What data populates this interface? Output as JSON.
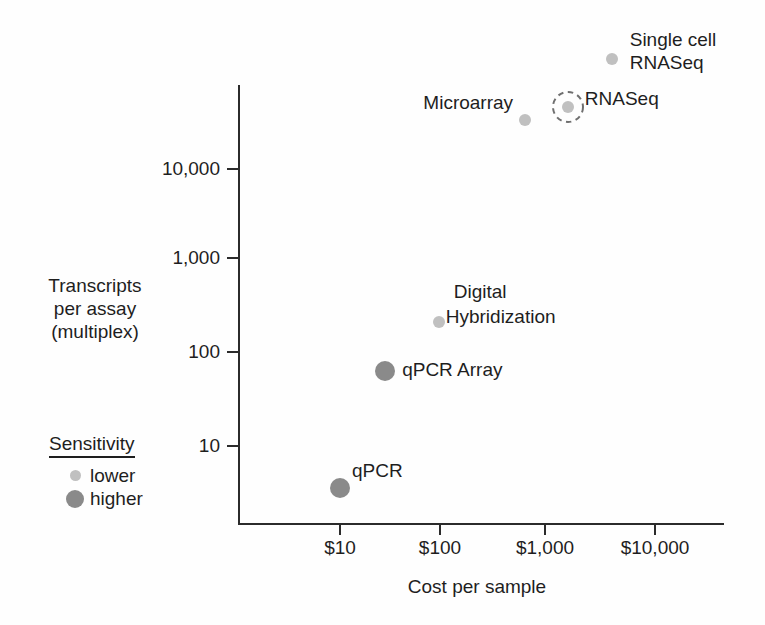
{
  "figure": {
    "y_side_label": {
      "lines": [
        "Transcripts",
        "per assay",
        "(multiplex)"
      ]
    },
    "legend": {
      "title": "Sensitivity",
      "items": [
        {
          "label": "lower",
          "sensitivity": "lower"
        },
        {
          "label": "higher",
          "sensitivity": "higher"
        }
      ]
    },
    "colors": {
      "sensitivity_lower": "#c0c0c0",
      "sensitivity_higher": "#8a8a8a",
      "axis": "#2b2b2b",
      "text": "#1e1e1e",
      "highlight_ring": "#6f6f6f"
    }
  },
  "chart_data": {
    "type": "scatter",
    "title": "",
    "xlabel": "Cost per sample",
    "ylabel": "Transcripts per assay (multiplex)",
    "x_scale": "log",
    "y_scale": "log",
    "x_axis": {
      "label": "Cost per sample",
      "ticks": [
        {
          "value": 10,
          "label": "$10"
        },
        {
          "value": 100,
          "label": "$100"
        },
        {
          "value": 1000,
          "label": "$1,000"
        },
        {
          "value": 10000,
          "label": "$10,000"
        }
      ]
    },
    "y_axis": {
      "label": "Transcripts per assay (multiplex)",
      "ticks": [
        {
          "value": 10,
          "label": "10"
        },
        {
          "value": 100,
          "label": "100"
        },
        {
          "value": 1000,
          "label": "1,000"
        },
        {
          "value": 10000,
          "label": "10,000"
        }
      ]
    },
    "legend": {
      "title": "Sensitivity",
      "entries": [
        "lower",
        "higher"
      ]
    },
    "points": [
      {
        "name": "qPCR",
        "label_lines": [
          "qPCR"
        ],
        "cost_usd": 10,
        "transcripts_per_assay": 3.5,
        "sensitivity": "higher",
        "highlighted": false
      },
      {
        "name": "qPCR Array",
        "label_lines": [
          "qPCR Array"
        ],
        "cost_usd": 28,
        "transcripts_per_assay": 65,
        "sensitivity": "higher",
        "highlighted": false
      },
      {
        "name": "Digital Hybridization",
        "label_lines": [
          "Digital",
          "Hybridization"
        ],
        "cost_usd": 95,
        "transcripts_per_assay": 220,
        "sensitivity": "lower",
        "highlighted": false
      },
      {
        "name": "Microarray",
        "label_lines": [
          "Microarray"
        ],
        "cost_usd": 680,
        "transcripts_per_assay": 33000,
        "sensitivity": "lower",
        "highlighted": false
      },
      {
        "name": "RNASeq",
        "label_lines": [
          "RNASeq"
        ],
        "cost_usd": 1800,
        "transcripts_per_assay": 45000,
        "sensitivity": "lower",
        "highlighted": true
      },
      {
        "name": "Single cell RNASeq",
        "label_lines": [
          "Single cell",
          "RNASeq"
        ],
        "cost_usd": 4900,
        "transcripts_per_assay": 150000,
        "sensitivity": "lower",
        "highlighted": false
      }
    ]
  }
}
